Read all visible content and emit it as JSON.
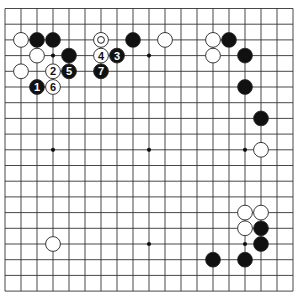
{
  "board": {
    "size": 19,
    "origin_x": 5,
    "origin_y": 8.5,
    "spacing_x": 16.0,
    "spacing_y": 15.7,
    "line_color": "#333333",
    "star_points": [
      [
        4,
        4
      ],
      [
        10,
        4
      ],
      [
        16,
        4
      ],
      [
        4,
        10
      ],
      [
        10,
        10
      ],
      [
        16,
        10
      ],
      [
        4,
        16
      ],
      [
        10,
        16
      ],
      [
        16,
        16
      ]
    ]
  },
  "stones": {
    "black": [
      [
        3,
        3
      ],
      [
        4,
        3
      ],
      [
        5,
        4
      ],
      [
        9,
        3
      ],
      [
        15,
        3
      ],
      [
        16,
        4
      ],
      [
        16,
        6
      ],
      [
        17,
        8
      ],
      [
        17,
        15
      ],
      [
        17,
        16
      ],
      [
        14,
        17
      ],
      [
        16,
        17
      ]
    ],
    "white": [
      [
        2,
        3
      ],
      [
        3,
        4
      ],
      [
        2,
        5
      ],
      [
        11,
        3
      ],
      [
        14,
        3
      ],
      [
        14,
        4
      ],
      [
        17,
        10
      ],
      [
        16,
        14
      ],
      [
        17,
        14
      ],
      [
        16,
        15
      ],
      [
        4,
        16
      ]
    ],
    "white_marked": [
      [
        7,
        3
      ]
    ],
    "numbered": [
      {
        "n": "1",
        "color": "black",
        "pos": [
          3,
          6
        ]
      },
      {
        "n": "2",
        "color": "white",
        "pos": [
          4,
          5
        ]
      },
      {
        "n": "3",
        "color": "black",
        "pos": [
          8,
          4
        ]
      },
      {
        "n": "4",
        "color": "white",
        "pos": [
          7,
          4
        ]
      },
      {
        "n": "5",
        "color": "black",
        "pos": [
          5,
          5
        ]
      },
      {
        "n": "6",
        "color": "white",
        "pos": [
          4,
          6
        ]
      },
      {
        "n": "7",
        "color": "black",
        "pos": [
          7,
          5
        ]
      }
    ]
  },
  "colors": {
    "black_stone": "#111111",
    "white_stone": "#ffffff",
    "stone_outline": "#222222"
  }
}
